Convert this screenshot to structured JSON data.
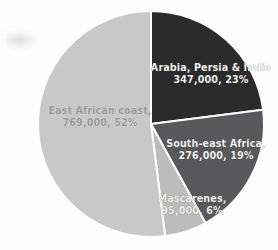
{
  "chart_data": {
    "type": "pie",
    "title": "",
    "subtitle": "",
    "xlabel": "",
    "ylabel": "",
    "legend_position": "none",
    "grid": false,
    "labels_inside_slices": true,
    "total": 1487000,
    "categories": [
      "Arabia, Persia & India",
      "South-east Africa",
      "Mascarenes",
      "East African coast"
    ],
    "values": [
      347000,
      276000,
      95000,
      769000
    ],
    "percentages": [
      23,
      19,
      6,
      52
    ],
    "start_angle_deg": 0,
    "direction": "clockwise",
    "slices": [
      {
        "name": "Arabia, Persia & India",
        "value": 347000,
        "value_text": "347,000",
        "percent": 23,
        "percent_text": "23%",
        "label_line1": "Arabia, Persia & India",
        "label_line2": "347,000,  23%",
        "color": "#2b2b2b",
        "start_deg": 0,
        "end_deg": 82.8
      },
      {
        "name": "South-east Africa",
        "value": 276000,
        "value_text": "276,000",
        "percent": 19,
        "percent_text": "19%",
        "label_line1": "South-east Africa,",
        "label_line2": "276,000,  19%",
        "color": "#59595b",
        "start_deg": 82.8,
        "end_deg": 151.2
      },
      {
        "name": "Mascarenes",
        "value": 95000,
        "value_text": "95,000",
        "percent": 6,
        "percent_text": "6%",
        "label_line1": "Mascarenes,",
        "label_line2": "95,000,  6%",
        "color": "#bdbdbd",
        "start_deg": 151.2,
        "end_deg": 172.8
      },
      {
        "name": "East African coast",
        "value": 769000,
        "value_text": "769,000",
        "percent": 52,
        "percent_text": "52%",
        "label_line1": "East African coast,",
        "label_line2": "769,000,  52%",
        "color": "#c9c9c9",
        "start_deg": 172.8,
        "end_deg": 360
      }
    ],
    "colors": {
      "arabia_persia_india": "#2b2b2b",
      "south_east_africa": "#59595b",
      "mascarenes": "#bdbdbd",
      "east_african_coast": "#c9c9c9",
      "separator": "#ffffff",
      "background": "#ffffff",
      "label_on_dark": "#f2f2f0",
      "label_on_light": "#9a9a9a"
    },
    "geometry": {
      "center_x": 151,
      "center_y": 124,
      "radius": 113
    }
  }
}
